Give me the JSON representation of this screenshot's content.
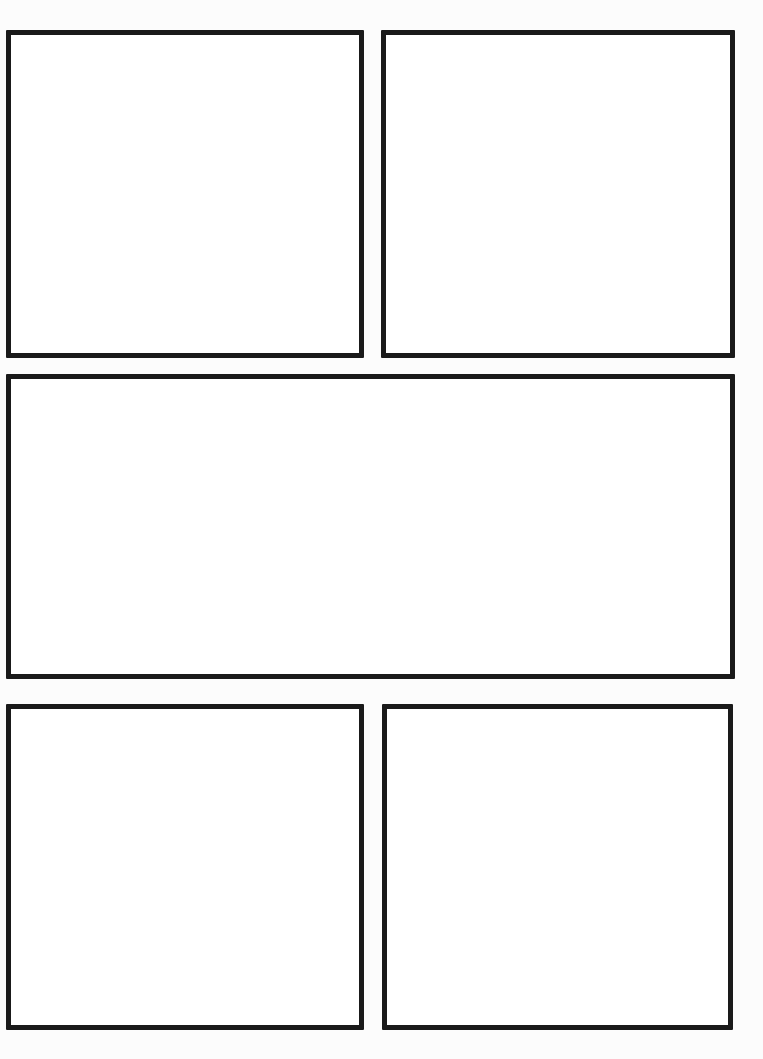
{
  "page": {
    "background_color": "#fcfcfc",
    "width": 763,
    "height": 1059,
    "border_color": "#1a1a1a",
    "panel_fill_color": "#ffffff",
    "border_width_px": 5,
    "layout": "3-row comic grid: 2 panels / 1 wide panel / 2 panels",
    "panel_count": 5
  },
  "panels": [
    {
      "id": "panel-1",
      "row": 1,
      "column": 1,
      "label": "",
      "content": "",
      "x": 6,
      "y": 30,
      "width": 358,
      "height": 328
    },
    {
      "id": "panel-2",
      "row": 1,
      "column": 2,
      "label": "",
      "content": "",
      "x": 381,
      "y": 30,
      "width": 354,
      "height": 328
    },
    {
      "id": "panel-3",
      "row": 2,
      "column": 1,
      "label": "",
      "content": "",
      "x": 6,
      "y": 374,
      "width": 729,
      "height": 305
    },
    {
      "id": "panel-4",
      "row": 3,
      "column": 1,
      "label": "",
      "content": "",
      "x": 6,
      "y": 704,
      "width": 358,
      "height": 326
    },
    {
      "id": "panel-5",
      "row": 3,
      "column": 2,
      "label": "",
      "content": "",
      "x": 382,
      "y": 704,
      "width": 351,
      "height": 326
    }
  ]
}
